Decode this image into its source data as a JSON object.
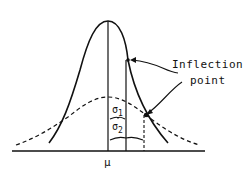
{
  "diagram": {
    "annotation": {
      "line1": "Inflection",
      "line2": "point"
    },
    "labels": {
      "mean": "μ",
      "sigma1": "σ",
      "sigma1_sub": "1",
      "sigma2": "σ",
      "sigma2_sub": "2"
    },
    "curves": [
      {
        "name": "narrow-normal-curve",
        "style": "solid",
        "sigma": "σ1"
      },
      {
        "name": "wide-normal-curve",
        "style": "dashed",
        "sigma": "σ2"
      }
    ],
    "colors": {
      "ink": "#111111",
      "background": "#ffffff"
    }
  }
}
